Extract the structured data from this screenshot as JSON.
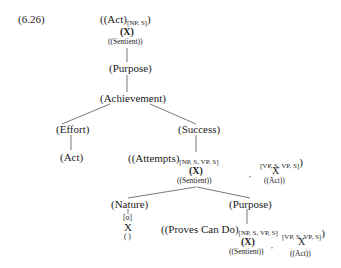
{
  "example_number": "(6.26)",
  "root": {
    "label": "((Act)",
    "subscript": "[NP, S]",
    "close": ")",
    "var": "(X)",
    "role": "((Sentient))"
  },
  "purpose1": "(Purpose)",
  "achievement": "(Achievement)",
  "effort": "(Effort)",
  "act": "(Act)",
  "success": "(Success)",
  "attempts": {
    "label": "((Attempts)",
    "sub1": "[NP, S, VP, S]",
    "var1": "(X)",
    "role1": "((Sentient))",
    "comma": ",",
    "sub2": "[VP, S, VP, S]",
    "close": ")",
    "var2": "X",
    "role2": "((Act))"
  },
  "nature": {
    "label": "(Nature)",
    "feature": "[σ]",
    "var": "X",
    "role": "( )"
  },
  "purpose2": "(Purpose)",
  "proves": {
    "label": "((Proves Can Do)",
    "sub1": "[NP, S, VP, S]",
    "var1": "(X)",
    "role1": "((Sentient))",
    "comma": ",",
    "sub2": "[VP, S, VP, S]",
    "close": ")",
    "var2": "X",
    "role2": "((Act))"
  }
}
